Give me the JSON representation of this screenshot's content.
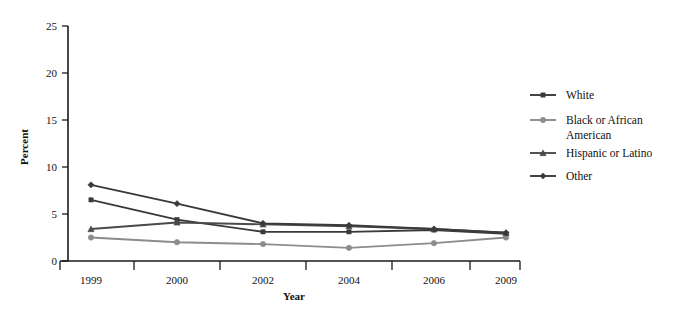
{
  "chart_data": {
    "type": "line",
    "title": "",
    "xlabel": "Year",
    "ylabel": "Percent",
    "categories": [
      "1999",
      "2000",
      "2002",
      "2004",
      "2006",
      "2009"
    ],
    "ylim": [
      0,
      25
    ],
    "yticks": [
      0,
      5,
      10,
      15,
      20,
      25
    ],
    "ytick_labels": [
      "0",
      "5",
      "10",
      "15",
      "20",
      "25"
    ],
    "grid": false,
    "legend_position": "right",
    "series": [
      {
        "name": "White",
        "marker": "square",
        "color": "#3a3a3a",
        "values": [
          6.5,
          4.4,
          3.1,
          3.1,
          3.3,
          2.9
        ]
      },
      {
        "name": "Black or African American",
        "marker": "circle",
        "color": "#8c8c8c",
        "values": [
          2.5,
          2.0,
          1.8,
          1.4,
          1.9,
          2.5
        ]
      },
      {
        "name": "Hispanic or Latino",
        "marker": "triangle",
        "color": "#4a4a4a",
        "values": [
          3.4,
          4.1,
          3.9,
          3.7,
          3.4,
          3.0
        ]
      },
      {
        "name": "Other",
        "marker": "diamond",
        "color": "#3a3a3a",
        "values": [
          8.1,
          6.1,
          4.0,
          3.8,
          3.4,
          3.0
        ]
      }
    ]
  },
  "legend": {
    "entries": [
      {
        "label": "White"
      },
      {
        "label": "Black or African",
        "label2": "American"
      },
      {
        "label": "Hispanic or Latino"
      },
      {
        "label": "Other"
      }
    ]
  },
  "axes": {
    "y_title": "Percent",
    "x_title": "Year"
  },
  "colors": {
    "axis": "#1a1a1a",
    "background": "#ffffff",
    "white_series": "#3a3a3a",
    "black_series": "#8c8c8c",
    "hispanic_series": "#4a4a4a",
    "other_series": "#3a3a3a"
  }
}
